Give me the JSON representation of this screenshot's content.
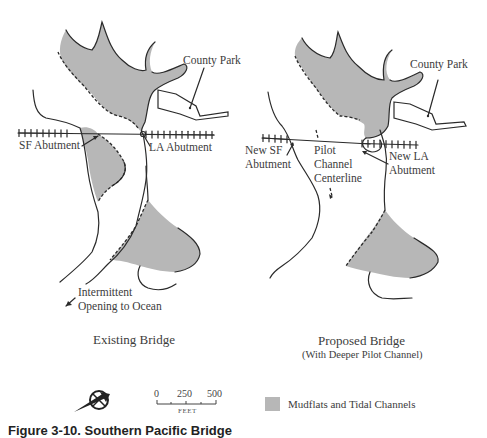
{
  "colors": {
    "mudflat_fill": "#b7b7b7",
    "line": "#2a2a2a",
    "background": "#ffffff"
  },
  "maps": [
    {
      "id": "existing",
      "title": "Existing Bridge",
      "subtitle": "",
      "labels": {
        "county_park": "County Park",
        "sf_abutment": "SF Abutment",
        "la_abutment": "LA Abutment",
        "opening_line1": "Intermittent",
        "opening_line2": "Opening to Ocean"
      }
    },
    {
      "id": "proposed",
      "title": "Proposed Bridge",
      "subtitle": "(With Deeper Pilot Channel)",
      "labels": {
        "county_park": "County Park",
        "new_sf_line1": "New SF",
        "new_sf_line2": "Abutment",
        "pilot_line1": "Pilot",
        "pilot_line2": "Channel",
        "pilot_line3": "Centerline",
        "new_la_line1": "New LA",
        "new_la_line2": "Abutment"
      }
    }
  ],
  "scale_bar": {
    "ticks": [
      "0",
      "250",
      "500"
    ],
    "unit": "FEET"
  },
  "north_arrow": {
    "icon": "north-arrow-compass-icon"
  },
  "legend": {
    "items": [
      {
        "label": "Mudflats and Tidal Channels",
        "icon": "mudflat-swatch"
      }
    ]
  },
  "caption": "Figure 3-10.  Southern Pacific Bridge"
}
